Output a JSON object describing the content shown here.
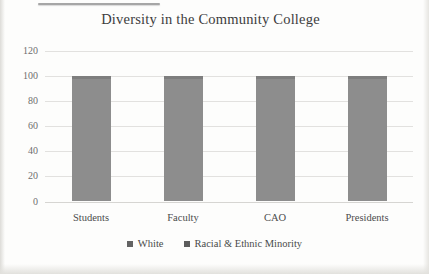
{
  "chart_data": {
    "type": "bar",
    "stacked": true,
    "title": "Diversity in the Community College",
    "categories": [
      "Students",
      "Faculty",
      "CAO",
      "Presidents"
    ],
    "series": [
      {
        "name": "White"
      },
      {
        "name": "Racial & Ethnic Minority"
      }
    ],
    "bar_totals": [
      100,
      100,
      100,
      100
    ],
    "note": "Grayscale scan: boundary between the two stacked segments is not visually distinguishable; each bar reads 100 on the axis.",
    "xlabel": "",
    "ylabel": "",
    "ylim": [
      0,
      120
    ],
    "yticks": [
      0,
      20,
      40,
      60,
      80,
      100,
      120
    ],
    "grid": true,
    "legend_position": "bottom",
    "colors": {
      "bar": "#8d8d8d",
      "bar_top_edge": "#7e7e7e",
      "gridline": "#e2e1df",
      "zero_line": "#d6d5d2",
      "legend_marker_white": "#636363",
      "legend_marker_minority": "#5c5c5c"
    }
  }
}
